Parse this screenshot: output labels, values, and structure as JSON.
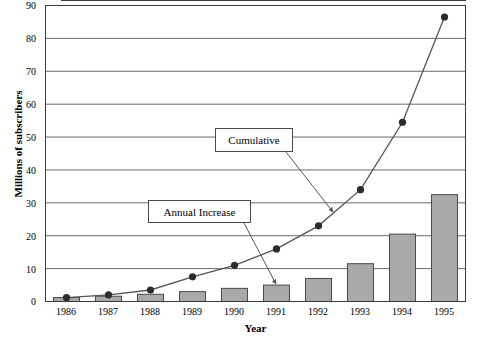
{
  "chart_data": {
    "type": "bar",
    "title": "",
    "xlabel": "Year",
    "ylabel": "Millions of subscribers",
    "categories": [
      "1986",
      "1987",
      "1988",
      "1989",
      "1990",
      "1991",
      "1992",
      "1993",
      "1994",
      "1995"
    ],
    "ylim": [
      0,
      90
    ],
    "yticks": [
      0,
      10,
      20,
      30,
      40,
      50,
      60,
      70,
      80,
      90
    ],
    "grid": true,
    "legend_position": "none",
    "series": [
      {
        "name": "Annual Increase",
        "type": "bar",
        "values": [
          1.2,
          1.6,
          2.2,
          3.0,
          4.0,
          5.0,
          7.0,
          11.5,
          20.5,
          32.5
        ]
      },
      {
        "name": "Cumulative",
        "type": "line",
        "values": [
          1.2,
          2.0,
          3.5,
          7.5,
          11.0,
          16.0,
          23.0,
          34.0,
          54.5,
          86.5
        ]
      }
    ],
    "annotations": [
      {
        "text": "Cumulative",
        "points_to_year": "1993",
        "points_to_value": 30
      },
      {
        "text": "Annual Increase",
        "points_to_year": "1991",
        "points_to_value": 5
      }
    ],
    "colors": {
      "bar_fill": "#a9a9a9",
      "bar_edge": "#4a4a4a",
      "line": "#555555",
      "marker": "#2b2b2b",
      "grid": "#6a6a6a",
      "axis": "#3a3a3a"
    }
  },
  "y_tick_labels": [
    "0",
    "10",
    "20",
    "30",
    "40",
    "50",
    "60",
    "70",
    "80",
    "90"
  ]
}
